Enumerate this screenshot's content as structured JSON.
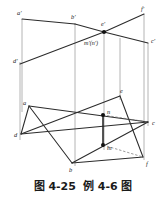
{
  "figure": {
    "caption_number": "图 4-25",
    "caption_title": "例 4-6 图",
    "colors": {
      "line": "#2b2b2b",
      "projector": "#8d8d8d",
      "dashed": "#6f6f6f",
      "label": "#1b1b1b",
      "background": "#ffffff"
    }
  },
  "labels": {
    "a_prime": "a'",
    "b_prime": "b'",
    "e_prime": "e'",
    "f_prime": "f'",
    "c_prime": "c'",
    "d_prime": "d'",
    "mn_prime": "m'(n')",
    "a": "a",
    "b": "b",
    "c": "c",
    "d": "d",
    "e": "e",
    "f": "f",
    "m": "m",
    "n": "n"
  },
  "geometry": {
    "front_view": {
      "points": {
        "a_prime": [
          22,
          19
        ],
        "b_prime": [
          75,
          24
        ],
        "e_prime": [
          104,
          32
        ],
        "f_prime": [
          144,
          14
        ],
        "c_prime": [
          148,
          43
        ],
        "d_prime": [
          20,
          64
        ],
        "mn_prime": [
          104,
          32
        ]
      },
      "edges": [
        [
          "a_prime",
          "b_prime"
        ],
        [
          "b_prime",
          "e_prime"
        ],
        [
          "e_prime",
          "c_prime"
        ],
        [
          "d_prime",
          "e_prime"
        ],
        [
          "e_prime",
          "f_prime"
        ]
      ]
    },
    "top_view": {
      "points": {
        "a": [
          29,
          106
        ],
        "b": [
          72,
          163
        ],
        "c": [
          148,
          122
        ],
        "d": [
          21,
          134
        ],
        "e": [
          120,
          96
        ],
        "f": [
          143,
          157
        ],
        "m": [
          103,
          145
        ],
        "n": [
          103,
          115
        ]
      },
      "edges": [
        [
          "a",
          "b"
        ],
        [
          "b",
          "c"
        ],
        [
          "c",
          "d"
        ],
        [
          "d",
          "a"
        ],
        [
          "a",
          "c"
        ],
        [
          "d",
          "e"
        ],
        [
          "e",
          "f"
        ],
        [
          "f",
          "b"
        ]
      ],
      "dashed_edges": [
        [
          "n",
          "c"
        ],
        [
          "m",
          "f"
        ]
      ],
      "connector": [
        "n",
        "m"
      ]
    },
    "projectors": [
      [
        22,
        19,
        22,
        112
      ],
      [
        20,
        62,
        20,
        140
      ],
      [
        75,
        24,
        75,
        166
      ],
      [
        104,
        30,
        104,
        150
      ],
      [
        120,
        38,
        120,
        100
      ],
      [
        144,
        14,
        144,
        160
      ],
      [
        148,
        43,
        148,
        126
      ]
    ]
  }
}
